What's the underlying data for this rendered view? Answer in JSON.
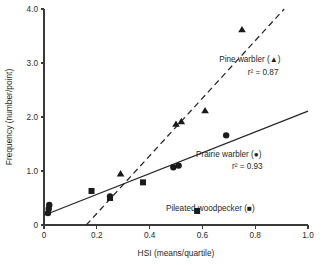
{
  "chart_data": {
    "type": "scatter",
    "title": "",
    "xlabel": "HSI (means/quartile)",
    "ylabel": "Frequency (number/point)",
    "xlim": [
      0,
      1.0
    ],
    "ylim": [
      0,
      4.0
    ],
    "xticks": [
      "0",
      "0.2",
      "0.4",
      "0.6",
      "0.8",
      "1.0"
    ],
    "xtick_values": [
      0,
      0.2,
      0.4,
      0.6,
      0.8,
      1.0
    ],
    "yticks": [
      "0",
      "1.0",
      "2.0",
      "3.0",
      "4.0"
    ],
    "ytick_values": [
      0,
      1.0,
      2.0,
      3.0,
      4.0
    ],
    "grid": false,
    "legend_position": "inside-right",
    "series": [
      {
        "name": "Pine warbler",
        "marker": "triangle",
        "r2": "0.87",
        "r2_label": "r²  =  0.87",
        "legend_label": "Pine warbler (▲)",
        "points": [
          {
            "x": 0.29,
            "y": 0.95
          },
          {
            "x": 0.5,
            "y": 1.87
          },
          {
            "x": 0.52,
            "y": 1.92
          },
          {
            "x": 0.61,
            "y": 2.12
          },
          {
            "x": 0.75,
            "y": 3.62
          }
        ],
        "fit_line": {
          "style": "dashed",
          "x0": 0.16,
          "y0": 0.0,
          "x1": 0.91,
          "y1": 4.0
        }
      },
      {
        "name": "Prairie warbler",
        "marker": "circle",
        "r2": "0.93",
        "r2_label": "r²  =  0.93",
        "legend_label": "Prairie warbler (●)",
        "points": [
          {
            "x": 0.015,
            "y": 0.22
          },
          {
            "x": 0.018,
            "y": 0.3
          },
          {
            "x": 0.02,
            "y": 0.37
          },
          {
            "x": 0.25,
            "y": 0.53
          },
          {
            "x": 0.49,
            "y": 1.07
          },
          {
            "x": 0.51,
            "y": 1.1
          },
          {
            "x": 0.69,
            "y": 1.66
          }
        ],
        "fit_line": {
          "style": "solid",
          "x0": 0.0,
          "y0": 0.18,
          "x1": 1.0,
          "y1": 2.11
        }
      },
      {
        "name": "Pileated woodpecker",
        "marker": "square",
        "r2": "",
        "r2_label": "",
        "legend_label": "Pileated woodpecker (■)",
        "points": [
          {
            "x": 0.18,
            "y": 0.63
          },
          {
            "x": 0.25,
            "y": 0.5
          },
          {
            "x": 0.375,
            "y": 0.79
          },
          {
            "x": 0.58,
            "y": 0.26
          }
        ],
        "fit_line": null
      }
    ],
    "annotations": [
      {
        "text": "Pine warbler (▲)",
        "x": 0.78,
        "y": 3.02
      },
      {
        "text": "r²  =  0.87",
        "x": 0.83,
        "y": 2.78
      },
      {
        "text": "Prairie warbler (●)",
        "x": 0.7,
        "y": 1.26
      },
      {
        "text": "r²  =  0.93",
        "x": 0.77,
        "y": 1.03
      },
      {
        "text": "Pileated woodpecker (■)",
        "x": 0.63,
        "y": 0.26
      }
    ]
  },
  "colors": {
    "marker": "#1b1b1b",
    "line": "#262626",
    "axis": "#3a3a3a",
    "text": "#1f1f1f",
    "background": "#ffffff"
  },
  "legend": {
    "pine": {
      "label": "Pine warbler (▲)",
      "r2": "r²  =  0.87"
    },
    "prairie": {
      "label": "Prairie warbler (●)",
      "r2": "r²  =  0.93"
    },
    "woodpecker": {
      "label": "Pileated woodpecker (■)"
    }
  },
  "axes": {
    "x_title": "HSI (means/quartile)",
    "y_title": "Frequency (number/point)"
  }
}
